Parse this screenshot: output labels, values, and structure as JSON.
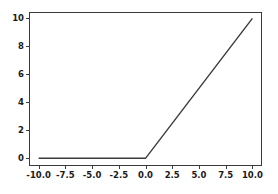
{
  "chart_data": {
    "type": "line",
    "title": "",
    "xlabel": "",
    "ylabel": "",
    "xlim": [
      -10.9,
      10.9
    ],
    "ylim": [
      -0.55,
      10.45
    ],
    "xticks": [
      -10.0,
      -7.5,
      -5.0,
      -2.5,
      0.0,
      2.5,
      5.0,
      7.5,
      10.0
    ],
    "xticklabels": [
      "-10.0",
      "-7.5",
      "-5.0",
      "-2.5",
      "0.0",
      "2.5",
      "5.0",
      "7.5",
      "10.0"
    ],
    "yticks": [
      0,
      2,
      4,
      6,
      8,
      10
    ],
    "yticklabels": [
      "0",
      "2",
      "4",
      "6",
      "8",
      "10"
    ],
    "grid": false,
    "legend": null,
    "series": [
      {
        "name": "relu",
        "color": "#3b3b3b",
        "linewidth": 1.4,
        "x": [
          -10.0,
          -9.0,
          -8.0,
          -7.0,
          -6.0,
          -5.0,
          -4.0,
          -3.0,
          -2.0,
          -1.0,
          0.0,
          1.0,
          2.0,
          3.0,
          4.0,
          5.0,
          6.0,
          7.0,
          8.0,
          9.0,
          10.0
        ],
        "y": [
          0.0,
          0.0,
          0.0,
          0.0,
          0.0,
          0.0,
          0.0,
          0.0,
          0.0,
          0.0,
          0.0,
          1.0,
          2.0,
          3.0,
          4.0,
          5.0,
          6.0,
          7.0,
          8.0,
          9.0,
          10.0
        ]
      }
    ],
    "axes_box": {
      "left": 29,
      "top": 12,
      "right": 262,
      "bottom": 166
    },
    "spine_color": "#3b3b3b",
    "background": "#ffffff",
    "tick_length": 3
  }
}
